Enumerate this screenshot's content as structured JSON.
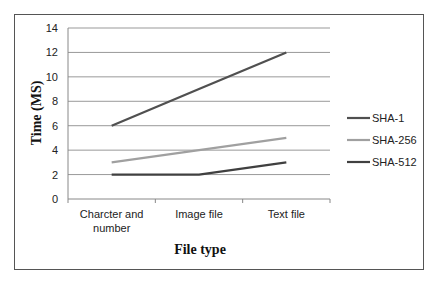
{
  "chart_data": {
    "type": "line",
    "title": "",
    "xlabel": "File type",
    "ylabel": "Time (MS)",
    "categories": [
      "Charcter and number",
      "Image file",
      "Text file"
    ],
    "series": [
      {
        "name": "SHA-1",
        "values": [
          6,
          9,
          12
        ],
        "color": "#505050"
      },
      {
        "name": "SHA-256",
        "values": [
          3,
          4,
          5
        ],
        "color": "#a0a0a0"
      },
      {
        "name": "SHA-512",
        "values": [
          2,
          2,
          3
        ],
        "color": "#404040"
      }
    ],
    "ylim": [
      0,
      14
    ],
    "yticks": [
      0,
      2,
      4,
      6,
      8,
      10,
      12,
      14
    ],
    "grid": true,
    "legend_position": "right"
  }
}
